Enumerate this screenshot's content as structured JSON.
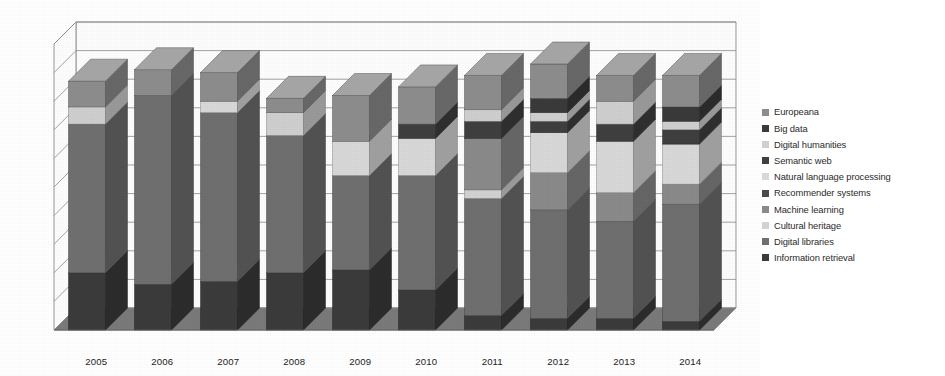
{
  "chart_data": {
    "type": "bar",
    "subtype": "3d-stacked-column",
    "title": "",
    "xlabel": "",
    "ylabel": "",
    "grid": true,
    "legend_position": "right",
    "ylim": [
      0,
      100
    ],
    "gridline_count": 10,
    "categories": [
      "2005",
      "2006",
      "2007",
      "2008",
      "2009",
      "2010",
      "2011",
      "2012",
      "2013",
      "2014"
    ],
    "series": [
      {
        "name": "Information retrieval",
        "color": "#3b3b3b",
        "values": [
          20,
          16,
          17,
          20,
          21,
          14,
          5,
          4,
          4,
          3
        ]
      },
      {
        "name": "Digital libraries",
        "color": "#6f6f6f",
        "values": [
          52,
          66,
          59,
          48,
          33,
          40,
          41,
          38,
          34,
          41
        ]
      },
      {
        "name": "Cultural heritage",
        "color": "#d2d2d2",
        "values": [
          0,
          0,
          0,
          0,
          0,
          0,
          3,
          0,
          0,
          0
        ]
      },
      {
        "name": "Machine learning",
        "color": "#8a8a8a",
        "values": [
          0,
          0,
          0,
          0,
          0,
          0,
          18,
          13,
          10,
          7
        ]
      },
      {
        "name": "Recommender systems",
        "color": "#4a4a4a",
        "values": [
          0,
          0,
          0,
          0,
          0,
          0,
          0,
          0,
          0,
          0
        ]
      },
      {
        "name": "Natural language processing",
        "color": "#d8d8d8",
        "values": [
          0,
          0,
          4,
          0,
          12,
          13,
          0,
          14,
          18,
          14
        ]
      },
      {
        "name": "Semantic web",
        "color": "#3f3f3f",
        "values": [
          0,
          0,
          0,
          0,
          0,
          5,
          6,
          4,
          6,
          5
        ]
      },
      {
        "name": "Digital humanities",
        "color": "#cfcfcf",
        "values": [
          6,
          0,
          0,
          8,
          0,
          0,
          4,
          3,
          8,
          3
        ]
      },
      {
        "name": "Big data",
        "color": "#3a3a3a",
        "values": [
          0,
          0,
          0,
          0,
          0,
          0,
          0,
          5,
          0,
          5
        ]
      },
      {
        "name": "Europeana",
        "color": "#8d8d8d",
        "values": [
          9,
          9,
          10,
          5,
          16,
          13,
          12,
          12,
          9,
          11
        ]
      }
    ]
  },
  "legend": {
    "items": [
      {
        "label": "Europeana",
        "color": "#8d8d8d"
      },
      {
        "label": "Big data",
        "color": "#3a3a3a"
      },
      {
        "label": "Digital humanities",
        "color": "#cfcfcf"
      },
      {
        "label": "Semantic web",
        "color": "#3f3f3f"
      },
      {
        "label": "Natural language processing",
        "color": "#d8d8d8"
      },
      {
        "label": "Recommender systems",
        "color": "#4a4a4a"
      },
      {
        "label": "Machine learning",
        "color": "#8a8a8a"
      },
      {
        "label": "Cultural heritage",
        "color": "#d2d2d2"
      },
      {
        "label": "Digital libraries",
        "color": "#6f6f6f"
      },
      {
        "label": "Information retrieval",
        "color": "#3b3b3b"
      }
    ]
  },
  "axis": {
    "x_ticks": [
      "2005",
      "2006",
      "2007",
      "2008",
      "2009",
      "2010",
      "2011",
      "2012",
      "2013",
      "2014"
    ]
  },
  "style": {
    "floor_color": "#7a7a7a",
    "wall_color": "#fdfdfd",
    "grid_color": "#8c8c8c",
    "side_shade": "#00000033",
    "top_shade": "#ffffff2e"
  }
}
